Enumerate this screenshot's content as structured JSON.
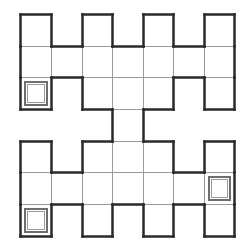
{
  "puzzle": {
    "cols": 7,
    "rows": 7,
    "origin": [
      20,
      14
    ],
    "col_edges": [
      20,
      51,
      82,
      112,
      143,
      173,
      204,
      234
    ],
    "row_edges": [
      14,
      46,
      77,
      109,
      141,
      172,
      204,
      236
    ],
    "cells": [
      [
        0,
        0
      ],
      [
        0,
        2
      ],
      [
        0,
        4
      ],
      [
        0,
        6
      ],
      [
        1,
        0
      ],
      [
        1,
        1
      ],
      [
        1,
        2
      ],
      [
        1,
        3
      ],
      [
        1,
        4
      ],
      [
        1,
        5
      ],
      [
        1,
        6
      ],
      [
        2,
        0
      ],
      [
        2,
        2
      ],
      [
        2,
        3
      ],
      [
        2,
        4
      ],
      [
        2,
        6
      ],
      [
        3,
        3
      ],
      [
        4,
        0
      ],
      [
        4,
        2
      ],
      [
        4,
        3
      ],
      [
        4,
        4
      ],
      [
        4,
        6
      ],
      [
        5,
        0
      ],
      [
        5,
        1
      ],
      [
        5,
        2
      ],
      [
        5,
        3
      ],
      [
        5,
        4
      ],
      [
        5,
        5
      ],
      [
        5,
        6
      ],
      [
        6,
        0
      ],
      [
        6,
        2
      ],
      [
        6,
        4
      ],
      [
        6,
        6
      ]
    ],
    "targets": [
      [
        2,
        0
      ],
      [
        5,
        6
      ],
      [
        6,
        0
      ]
    ],
    "colors": {
      "outline": "#2a2a2a",
      "grid": "#9a9a9a",
      "target": "#6e6e6e",
      "background": "#ffffff"
    }
  }
}
